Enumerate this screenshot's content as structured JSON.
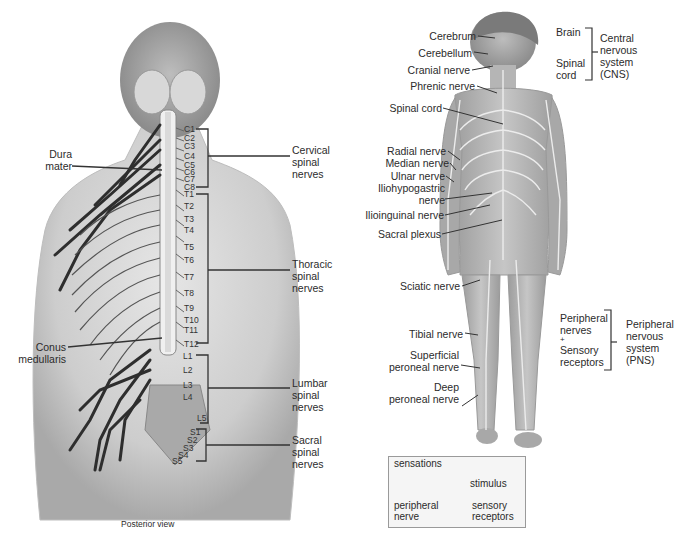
{
  "posterior": {
    "caption": "Posterior view",
    "dura_mater": [
      "Dura",
      "mater"
    ],
    "conus_medullaris": [
      "Conus",
      "medullaris"
    ],
    "groups": {
      "cervical": [
        "Cervical",
        "spinal",
        "nerves"
      ],
      "thoracic": [
        "Thoracic",
        "spinal",
        "nerves"
      ],
      "lumbar": [
        "Lumbar",
        "spinal",
        "nerves"
      ],
      "sacral": [
        "Sacral",
        "spinal",
        "nerves"
      ]
    },
    "segments": {
      "cervical": [
        "C1",
        "C2",
        "C3",
        "C4",
        "C5",
        "C6",
        "C7",
        "C8"
      ],
      "thoracic": [
        "T1",
        "T2",
        "T3",
        "T4",
        "T5",
        "T6",
        "T7",
        "T8",
        "T9",
        "T10",
        "T11",
        "T12"
      ],
      "lumbar": [
        "L1",
        "L2",
        "L3",
        "L4",
        "L5"
      ],
      "sacral": [
        "S1",
        "S2",
        "S3",
        "S4",
        "S5"
      ]
    }
  },
  "anterior": {
    "labels": {
      "cerebrum": "Cerebrum",
      "cerebellum": "Cerebellum",
      "cranial_nerve": "Cranial nerve",
      "phrenic_nerve": "Phrenic nerve",
      "spinal_cord": "Spinal cord",
      "radial_nerve": "Radial nerve",
      "median_nerve": "Median nerve",
      "ulnar_nerve": "Ulnar nerve",
      "iliohypogastric_nerve": [
        "Iliohypogastric",
        "nerve"
      ],
      "ilioinguinal_nerve": "Ilioinguinal nerve",
      "sacral_plexus": "Sacral plexus",
      "sciatic_nerve": "Sciatic nerve",
      "tibial_nerve": "Tibial nerve",
      "superficial_peroneal_nerve": [
        "Superficial",
        "peroneal nerve"
      ],
      "deep_peroneal_nerve": [
        "Deep",
        "peroneal nerve"
      ]
    },
    "cns": {
      "brain": "Brain",
      "spinal_cord": [
        "Spinal",
        "cord"
      ],
      "title": [
        "Central",
        "nervous",
        "system",
        "(CNS)"
      ]
    },
    "pns": {
      "components": [
        "Peripheral",
        "nerves",
        "+",
        "Sensory",
        "receptors"
      ],
      "title": [
        "Peripheral",
        "nervous",
        "system",
        "(PNS)"
      ]
    }
  },
  "inset": {
    "sensations": "sensations",
    "stimulus": "stimulus",
    "peripheral_nerve": [
      "peripheral",
      "nerve"
    ],
    "sensory_receptors": [
      "sensory",
      "receptors"
    ]
  },
  "colors": {
    "skin_back": "#c9c9c9",
    "skin_front": "#b8b8b8",
    "nerve_dark": "#2e2e2e",
    "nerve_light": "#e8e8e8",
    "line": "#333333"
  }
}
